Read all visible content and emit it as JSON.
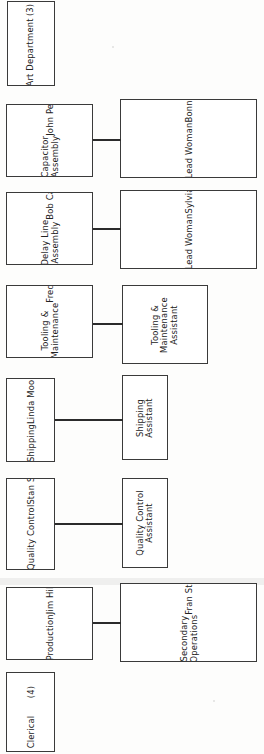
{
  "document": {
    "kind": "organizational-chart",
    "orientation": "rotated-90-counterclockwise",
    "note": "Manufacturing department organization chart, text reads bottom-to-top",
    "colors": {
      "page_background": "#fdfdfc",
      "box_fill": "#ffffff",
      "box_border": "#3a3a3a",
      "connector": "#2b2b2b",
      "text": "#222222"
    }
  },
  "nodes": [
    {
      "id": "art-department",
      "column": "left",
      "lines": [
        [
          "Art Department"
        ],
        [
          "(3)"
        ]
      ]
    },
    {
      "id": "capacitor-assembly",
      "column": "left",
      "lines": [
        [
          "Capacitor",
          "Assembly"
        ],
        [
          "John Peak"
        ]
      ]
    },
    {
      "id": "capacitor-lead-woman",
      "column": "right",
      "lines": [
        [
          "Lead Woman"
        ],
        [
          "Bonnie Parks"
        ],
        [
          "Assemblers",
          "(15)"
        ]
      ]
    },
    {
      "id": "delay-line-assembly",
      "column": "left",
      "lines": [
        [
          "Delay Line",
          "Assembly"
        ],
        [
          "Bob Carnes"
        ]
      ]
    },
    {
      "id": "delay-line-lead-woman",
      "column": "right",
      "lines": [
        [
          "Lead Woman"
        ],
        [
          "Sylvia Fritz"
        ],
        [
          "Assemblers",
          "(15)"
        ]
      ]
    },
    {
      "id": "tooling-maintenance",
      "column": "left",
      "lines": [
        [
          "Tooling &",
          "Maintenance"
        ],
        [
          "Fred Levy"
        ]
      ]
    },
    {
      "id": "tooling-maintenance-assistant",
      "column": "right",
      "lines": [
        [
          "Tooling &",
          "Maintenance",
          "Assistant"
        ]
      ]
    },
    {
      "id": "shipping",
      "column": "left",
      "lines": [
        [
          "Shipping"
        ],
        [
          "Linda Moore"
        ]
      ]
    },
    {
      "id": "shipping-assistant",
      "column": "right",
      "lines": [
        [
          "Shipping",
          "Assistant"
        ]
      ]
    },
    {
      "id": "quality-control",
      "column": "left",
      "lines": [
        [
          "Quality Control"
        ],
        [
          "Stan Sanders"
        ]
      ]
    },
    {
      "id": "quality-control-assistant",
      "column": "right",
      "lines": [
        [
          "Quality Control",
          "Assistant"
        ]
      ]
    },
    {
      "id": "production",
      "column": "left",
      "lines": [
        [
          "Production"
        ],
        [
          "Jim Hill"
        ],
        [
          "Tom Wacker"
        ]
      ]
    },
    {
      "id": "secondary-operations",
      "column": "right",
      "lines": [
        [
          "Secondary",
          "Operations"
        ],
        [
          "Fran Stills"
        ],
        [
          "Operators",
          "(45)"
        ]
      ]
    },
    {
      "id": "clerical",
      "column": "left",
      "lines": [
        [
          "Clerical"
        ],
        [
          "(4)"
        ]
      ]
    }
  ],
  "connections": [
    {
      "from": "capacitor-assembly",
      "to": "capacitor-lead-woman"
    },
    {
      "from": "delay-line-assembly",
      "to": "delay-line-lead-woman"
    },
    {
      "from": "tooling-maintenance",
      "to": "tooling-maintenance-assistant"
    },
    {
      "from": "shipping",
      "to": "shipping-assistant"
    },
    {
      "from": "quality-control",
      "to": "quality-control-assistant"
    },
    {
      "from": "production",
      "to": "secondary-operations"
    }
  ],
  "layout": {
    "nodes": {
      "art-department": {
        "x": 7,
        "y": 1,
        "w": 48,
        "h": 85
      },
      "capacitor-assembly": {
        "x": 6,
        "y": 104,
        "w": 87,
        "h": 73
      },
      "capacitor-lead-woman": {
        "x": 120,
        "y": 99,
        "w": 137,
        "h": 79
      },
      "delay-line-assembly": {
        "x": 6,
        "y": 192,
        "w": 87,
        "h": 73
      },
      "delay-line-lead-woman": {
        "x": 120,
        "y": 190,
        "w": 137,
        "h": 79
      },
      "tooling-maintenance": {
        "x": 6,
        "y": 285,
        "w": 87,
        "h": 73
      },
      "tooling-maintenance-assistant": {
        "x": 122,
        "y": 285,
        "w": 86,
        "h": 79
      },
      "shipping": {
        "x": 6,
        "y": 378,
        "w": 49,
        "h": 84
      },
      "shipping-assistant": {
        "x": 122,
        "y": 375,
        "w": 46,
        "h": 85
      },
      "quality-control": {
        "x": 6,
        "y": 478,
        "w": 49,
        "h": 92
      },
      "quality-control-assistant": {
        "x": 122,
        "y": 478,
        "w": 46,
        "h": 90
      },
      "production": {
        "x": 6,
        "y": 587,
        "w": 87,
        "h": 73
      },
      "secondary-operations": {
        "x": 120,
        "y": 583,
        "w": 137,
        "h": 79
      },
      "clerical": {
        "x": 6,
        "y": 672,
        "w": 49,
        "h": 80
      }
    },
    "connections": [
      {
        "x": 93,
        "y": 139,
        "w": 28
      },
      {
        "x": 93,
        "y": 228,
        "w": 28
      },
      {
        "x": 93,
        "y": 323,
        "w": 30
      },
      {
        "x": 55,
        "y": 419,
        "w": 68
      },
      {
        "x": 55,
        "y": 523,
        "w": 68
      },
      {
        "x": 93,
        "y": 622,
        "w": 28
      }
    ]
  }
}
